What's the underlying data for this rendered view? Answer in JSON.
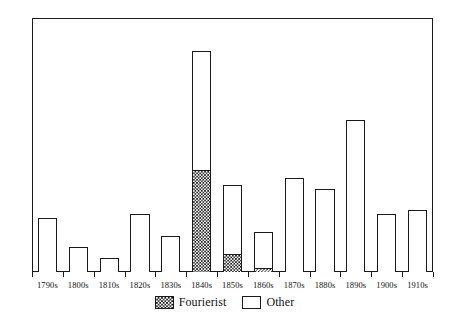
{
  "chart_data": {
    "type": "bar",
    "stacked": true,
    "title": "",
    "subtitle": "",
    "xlabel": "",
    "ylabel": "",
    "ylim": [
      0,
      70
    ],
    "xlim": [
      0,
      13
    ],
    "y_ticks": [
      0,
      10,
      20,
      30,
      40,
      50,
      60,
      70
    ],
    "grid": false,
    "legend_position": "bottom-center",
    "categories": [
      "1790s",
      "1800s",
      "1810s",
      "1820s",
      "1830s",
      "1840s",
      "1850s",
      "1860s",
      "1870s",
      "1880s",
      "1890s",
      "1900s",
      "1910s"
    ],
    "series": [
      {
        "name": "Fourierist",
        "fill": "checkerboard-hatch",
        "color": "#111111",
        "values": [
          0,
          0,
          0,
          0,
          0,
          28,
          5,
          1,
          0,
          0,
          0,
          0,
          0
        ]
      },
      {
        "name": "Other",
        "fill": "solid-white",
        "color": "#ffffff",
        "values": [
          15,
          7,
          4,
          16,
          10,
          33,
          19,
          10,
          26,
          23,
          42,
          16,
          17
        ]
      }
    ],
    "totals": [
      15,
      7,
      4,
      16,
      10,
      61,
      24,
      11,
      26,
      23,
      42,
      16,
      17
    ]
  },
  "axes": {
    "y_tick_labels": [
      "0",
      "10",
      "20",
      "30",
      "40",
      "50",
      "60",
      "70"
    ],
    "x_tick_labels": [
      "1790s",
      "1800s",
      "1810s",
      "1820s",
      "1830s",
      "1840s",
      "1850s",
      "1860s",
      "1870s",
      "1880s",
      "1890s",
      "1900s",
      "1910s"
    ]
  },
  "legend": {
    "items": [
      {
        "label": "Fourierist",
        "swatch": "checkerboard-hatch"
      },
      {
        "label": "Other",
        "swatch": "solid-white"
      }
    ]
  },
  "colors": {
    "axis": "#1a1a1a",
    "bar_outline": "#1a1a1a",
    "bar_other_fill": "#ffffff",
    "bar_fourierist_fill": "#111111",
    "background": "#ffffff"
  }
}
